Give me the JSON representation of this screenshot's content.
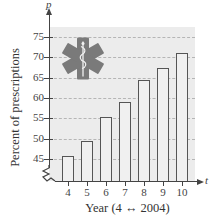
{
  "chart_data": {
    "type": "bar",
    "title": "",
    "xlabel": "Year (4 ↔ 2004)",
    "ylabel": "Percent of prescriptions",
    "x_axis_var": "t",
    "y_axis_var": "p",
    "categories": [
      "4",
      "5",
      "6",
      "7",
      "8",
      "9",
      "10"
    ],
    "values": [
      45.8,
      49.3,
      55.2,
      59.0,
      64.5,
      67.3,
      71.1
    ],
    "yticks": [
      "45",
      "50",
      "55",
      "60",
      "65",
      "70",
      "75"
    ],
    "ylim": [
      40,
      78
    ],
    "y_axis_break": true,
    "grid": true,
    "grid_style": "dashed horizontal",
    "legend": null,
    "decoration": "star-of-life emblem",
    "colors": {
      "bar_fill": "#f0f0f0",
      "bar_edge": "#555555",
      "plot_bg": "#ececec",
      "emblem": "#7a7a7a"
    }
  }
}
